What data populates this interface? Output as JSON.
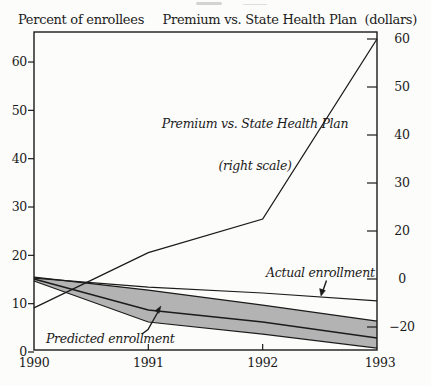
{
  "page": {
    "background": "#fcfcfa",
    "ink": "#1b1b1b"
  },
  "header": {
    "left_title": "Percent of enrollees",
    "right_title": "Premium vs. State Health Plan  (dollars)"
  },
  "chart_data": {
    "type": "line",
    "categories": [
      1990,
      1991,
      1992,
      1993
    ],
    "x_labels": [
      "1990",
      "1991",
      "1992",
      "1993"
    ],
    "left_axis": {
      "title": "Percent of enrollees",
      "ticks": [
        0,
        10,
        20,
        30,
        40,
        50,
        60
      ],
      "range": [
        0,
        66
      ]
    },
    "right_axis": {
      "title": "Premium vs. State Health Plan (dollars)",
      "tick_values": [
        60,
        50,
        40,
        30,
        20,
        0,
        -20
      ],
      "tick_labels": [
        "60",
        "50",
        "40",
        "30",
        "20",
        "0",
        "−20"
      ],
      "scale_note": "axis compressed below 20: same tick spacing spans 20 units"
    },
    "series": [
      {
        "key": "premium",
        "name": "Premium vs. State Health Plan",
        "axis": "right",
        "values": [
          -12,
          11,
          22.5,
          60
        ]
      },
      {
        "key": "actual",
        "name": "Actual enrollment",
        "axis": "left",
        "values": [
          15.3,
          13.4,
          12.2,
          10.6
        ]
      },
      {
        "key": "predicted",
        "name": "Predicted enrollment",
        "axis": "left",
        "values": [
          15.1,
          8.7,
          6.2,
          2.9
        ]
      },
      {
        "key": "band_upper",
        "name": "Predicted enrollment (upper bound)",
        "axis": "left",
        "values": [
          15.5,
          12.8,
          9.7,
          6.4
        ]
      },
      {
        "key": "band_lower",
        "name": "Predicted enrollment (lower bound)",
        "axis": "left",
        "values": [
          14.7,
          6.2,
          3.7,
          0.8
        ]
      }
    ],
    "band_fill": "#b3b3b3",
    "legend_position": "none",
    "grid": false,
    "annotations": {
      "premium_label_line1": "Premium vs. State Health Plan",
      "premium_label_line2": "(right scale)",
      "actual_label": "Actual enrollment",
      "predicted_label": "Predicted enrollment"
    }
  }
}
